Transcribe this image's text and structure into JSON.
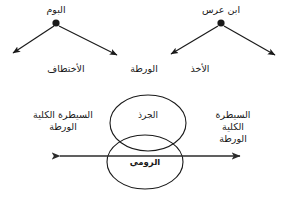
{
  "figure": {
    "type": "concept-diagram",
    "language": "ar",
    "background_color": "#ffffff",
    "stroke_color": "#1a1a1a",
    "text_color": "#1a1a1a"
  },
  "tree": {
    "nodes": [
      {
        "id": "node-left",
        "label": "البوم",
        "x": 56,
        "y": 23
      },
      {
        "id": "node-right",
        "label": "ابن عرس",
        "x": 221,
        "y": 23
      }
    ],
    "edge_labels": [
      {
        "id": "edge-label-abduction",
        "label": "الأختطاف",
        "x": 66,
        "y": 70
      },
      {
        "id": "edge-label-predicament",
        "label": "الورطة",
        "x": 144,
        "y": 70
      },
      {
        "id": "edge-label-taking",
        "label": "الأخذ",
        "x": 200,
        "y": 70
      }
    ]
  },
  "venn": {
    "upper_ellipse_label": "الجرذ",
    "lower_ellipse_label": "الرومي",
    "left_side_label": "السيطرة الكلية\nالورطة",
    "right_side_label": "السيطرة الكلية\nالورطة",
    "axis": {
      "label": "",
      "left_arrow": "◀",
      "right_arrow": "▶"
    }
  }
}
